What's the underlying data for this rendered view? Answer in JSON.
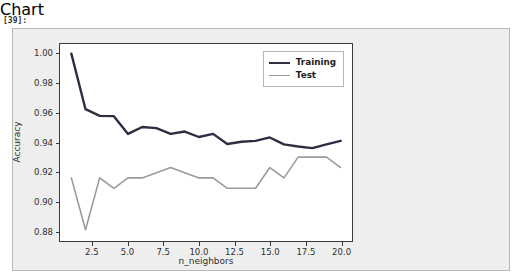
{
  "notebook": {
    "cell_prompt": "[39]:"
  },
  "chart_data": {
    "type": "line",
    "title": "",
    "xlabel": "n_neighbors",
    "ylabel": "Accuracy",
    "xlim": [
      0.2,
      20.8
    ],
    "ylim": [
      0.8735,
      1.0065
    ],
    "grid": false,
    "legend_position": "upper right",
    "xticks": [
      "2.5",
      "5.0",
      "7.5",
      "10.0",
      "12.5",
      "15.0",
      "17.5",
      "20.0"
    ],
    "xtick_values": [
      2.5,
      5.0,
      7.5,
      10.0,
      12.5,
      15.0,
      17.5,
      20.0
    ],
    "yticks": [
      "0.88",
      "0.90",
      "0.92",
      "0.94",
      "0.96",
      "0.98",
      "1.00"
    ],
    "ytick_values": [
      0.88,
      0.9,
      0.92,
      0.94,
      0.96,
      0.98,
      1.0
    ],
    "x": [
      1,
      2,
      3,
      4,
      5,
      6,
      7,
      8,
      9,
      10,
      11,
      12,
      13,
      14,
      15,
      16,
      17,
      18,
      19,
      20
    ],
    "series": [
      {
        "name": "Training",
        "color": "#2c2f42",
        "width": 2.4,
        "values": [
          1.0,
          0.9625,
          0.958,
          0.9578,
          0.9458,
          0.9505,
          0.9497,
          0.9458,
          0.9474,
          0.9437,
          0.9458,
          0.939,
          0.9405,
          0.9411,
          0.9434,
          0.9387,
          0.9373,
          0.9362,
          0.9387,
          0.9411
        ]
      },
      {
        "name": "Test",
        "color": "#9b9b9b",
        "width": 1.6,
        "values": [
          0.9161,
          0.8811,
          0.9161,
          0.9091,
          0.9161,
          0.9161,
          0.9196,
          0.9231,
          0.9196,
          0.9161,
          0.9161,
          0.9091,
          0.9091,
          0.9091,
          0.9231,
          0.9161,
          0.9301,
          0.9301,
          0.9301,
          0.9231
        ]
      }
    ]
  }
}
